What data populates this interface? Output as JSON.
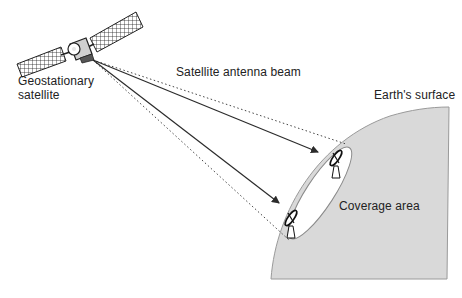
{
  "labels": {
    "satellite": "Geostationary\nsatellite",
    "beam": "Satellite antenna beam",
    "earth": "Earth's surface",
    "coverage": "Coverage area"
  },
  "colors": {
    "earth_fill": "#d9d9d9",
    "earth_stroke": "#9a9a9a",
    "line": "#333333",
    "coverage_fill": "#ffffff"
  },
  "elements": {
    "satellite": "satellite-icon",
    "earth_station_top": "dish-antenna-icon",
    "earth_station_bottom": "dish-antenna-icon",
    "beam_arrows": 2,
    "beam_edges": 2
  }
}
